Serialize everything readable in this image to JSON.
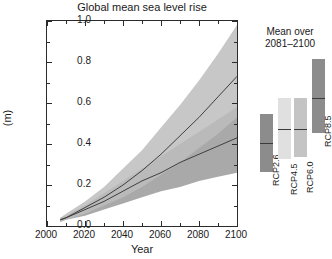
{
  "chart_data": {
    "type": "area",
    "title": "Global mean sea level rise",
    "xlabel": "Year",
    "ylabel": "(m)",
    "xlim": [
      2000,
      2100
    ],
    "ylim": [
      0.0,
      1.0
    ],
    "xticks": [
      2000,
      2020,
      2040,
      2060,
      2080,
      2100
    ],
    "xtick_labels": [
      "2000",
      "2020",
      "2040",
      "2060",
      "2080",
      "2100"
    ],
    "xtick_minor_step": 10,
    "yticks": [
      0.0,
      0.2,
      0.4,
      0.6,
      0.8,
      1.0
    ],
    "ytick_labels": [
      "0.0",
      "0.2",
      "0.4",
      "0.6",
      "0.8",
      "1.0"
    ],
    "ytick_minor_step": 0.1,
    "grid": false,
    "legend_position": "none",
    "x": [
      2007,
      2010,
      2020,
      2030,
      2040,
      2050,
      2060,
      2070,
      2080,
      2090,
      2100
    ],
    "series": [
      {
        "name": "RCP2.6",
        "kind": "median-line",
        "color": "#6e6e6e",
        "values": [
          0.03,
          0.04,
          0.08,
          0.12,
          0.17,
          0.22,
          0.26,
          0.31,
          0.35,
          0.39,
          0.43
        ]
      },
      {
        "name": "RCP8.5",
        "kind": "median-line",
        "color": "#6e6e6e",
        "values": [
          0.03,
          0.04,
          0.09,
          0.14,
          0.2,
          0.27,
          0.35,
          0.44,
          0.53,
          0.63,
          0.73
        ]
      },
      {
        "name": "RCP2.6 likely range",
        "kind": "band",
        "color": "#9a9a9a",
        "lower": [
          0.02,
          0.03,
          0.05,
          0.08,
          0.11,
          0.14,
          0.17,
          0.19,
          0.22,
          0.24,
          0.26
        ],
        "upper": [
          0.04,
          0.05,
          0.1,
          0.16,
          0.22,
          0.28,
          0.34,
          0.4,
          0.46,
          0.52,
          0.58
        ]
      },
      {
        "name": "RCP8.5 likely range",
        "kind": "band",
        "color": "#bdbdbd",
        "lower": [
          0.02,
          0.03,
          0.06,
          0.1,
          0.14,
          0.19,
          0.25,
          0.31,
          0.38,
          0.45,
          0.53
        ],
        "upper": [
          0.04,
          0.06,
          0.12,
          0.19,
          0.28,
          0.37,
          0.48,
          0.59,
          0.71,
          0.84,
          0.98
        ]
      }
    ]
  },
  "title": "Global mean sea level rise",
  "axes": {
    "x_title": "Year",
    "y_title": "(m)",
    "x_ticks": [
      "2000",
      "2020",
      "2040",
      "2060",
      "2080",
      "2100"
    ],
    "y_ticks": [
      "0.0",
      "0.2",
      "0.4",
      "0.6",
      "0.8",
      "1.0"
    ]
  },
  "right_panel": {
    "heading_line1": "Mean over",
    "heading_line2": "2081–2100",
    "bars": [
      {
        "label": "RCP2.6",
        "low": 0.26,
        "high": 0.54,
        "median": 0.4,
        "color": "#8c8c8c"
      },
      {
        "label": "RCP4.5",
        "low": 0.32,
        "high": 0.62,
        "median": 0.47,
        "color": "#e0e0e0"
      },
      {
        "label": "RCP6.0",
        "low": 0.33,
        "high": 0.62,
        "median": 0.47,
        "color": "#c4c4c4"
      },
      {
        "label": "RCP8.5",
        "low": 0.45,
        "high": 0.81,
        "median": 0.62,
        "color": "#8c8c8c"
      }
    ]
  }
}
